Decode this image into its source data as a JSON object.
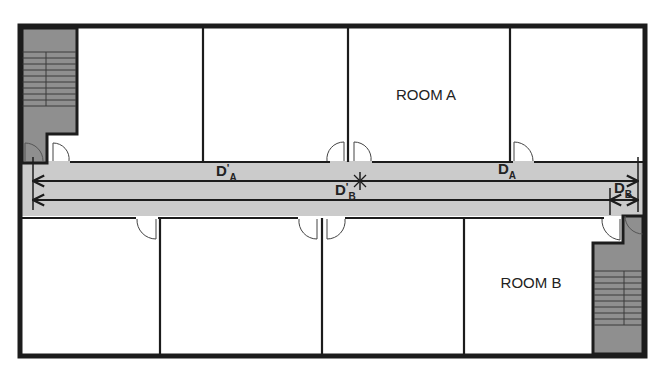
{
  "diagram": {
    "type": "floor-plan",
    "colors": {
      "wall": "#1c1c1c",
      "corridor": "#cbcbcb",
      "stair": "#8f8f8f",
      "room": "#ffffff",
      "dimension_line": "#1c1c1c"
    },
    "rooms": {
      "room_a": {
        "label": "ROOM A"
      },
      "room_b": {
        "label": "ROOM B"
      }
    },
    "dimensions": {
      "d_a_prime": {
        "main": "D",
        "prime": "'",
        "sub": "A"
      },
      "d_b_prime": {
        "main": "D",
        "prime": "'",
        "sub": "B"
      },
      "d_a": {
        "main": "D",
        "sub": "A"
      },
      "d_b": {
        "main": "D",
        "sub": "B"
      }
    },
    "stairwells": [
      {
        "name": "stairwell-top-left",
        "steps": 9
      },
      {
        "name": "stairwell-bottom-right",
        "steps": 9
      }
    ]
  }
}
